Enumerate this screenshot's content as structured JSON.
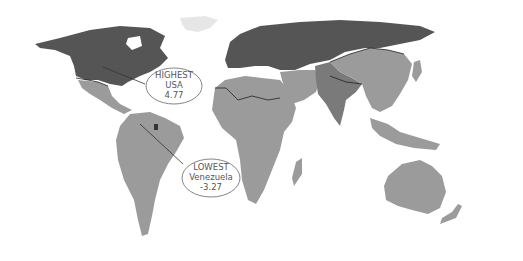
{
  "map": {
    "type": "world-choropleth",
    "colors": {
      "highest_group": "#555555",
      "south_asia": "#7a7a7a",
      "middle_group": "#9b9b9b",
      "greenland": "#e8e8e8",
      "background": "#ffffff",
      "border_line": "#222222",
      "callout_stroke": "#666666",
      "callout_text": "#555555"
    },
    "callouts": [
      {
        "id": "highest",
        "lines": [
          "HIGHEST",
          "USA",
          "4.77"
        ],
        "label": "HIGHEST",
        "country": "USA",
        "value": "4.77"
      },
      {
        "id": "lowest",
        "lines": [
          "LOWEST",
          "Venezuela",
          "-3.27"
        ],
        "label": "LOWEST",
        "country": "Venezuela",
        "value": "-3.27"
      }
    ]
  }
}
